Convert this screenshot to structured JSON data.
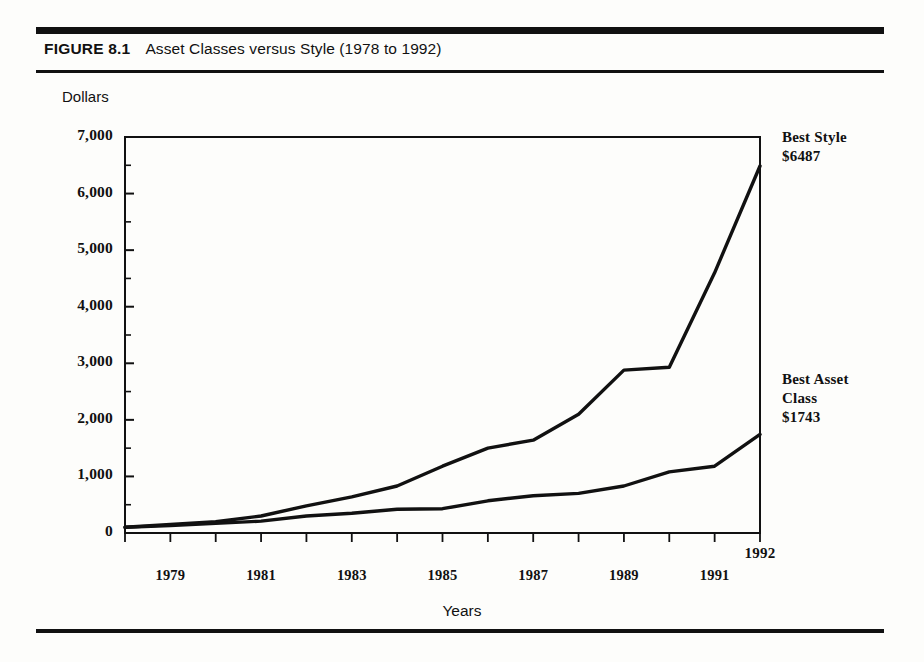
{
  "figure": {
    "number_label": "FIGURE 8.1",
    "caption": "Asset Classes versus Style (1978 to 1992)"
  },
  "annotations": {
    "best_style": {
      "line1": "Best Style",
      "line2": "$6487"
    },
    "best_asset_class": {
      "line1": "Best Asset",
      "line2": "Class",
      "line3": "$1743"
    }
  },
  "chart_data": {
    "type": "line",
    "title": "Asset Classes versus Style (1978 to 1992)",
    "xlabel": "Years",
    "ylabel": "Dollars",
    "xlim": [
      1978,
      1992
    ],
    "ylim": [
      0,
      7000
    ],
    "grid": false,
    "legend_position": "right-inline-annotations",
    "x": [
      1978,
      1979,
      1980,
      1981,
      1982,
      1983,
      1984,
      1985,
      1986,
      1987,
      1988,
      1989,
      1990,
      1991,
      1992
    ],
    "x_tick_labels": [
      "1979",
      "1981",
      "1983",
      "1985",
      "1987",
      "1989",
      "1991",
      "1992"
    ],
    "y_tick_labels": [
      "0",
      "1,000",
      "2,000",
      "3,000",
      "4,000",
      "5,000",
      "6,000",
      "7,000"
    ],
    "y_ticks": [
      0,
      1000,
      2000,
      3000,
      4000,
      5000,
      6000,
      7000
    ],
    "y_minor_ticks": [
      500,
      1500,
      2500,
      3500,
      4500,
      5500,
      6500
    ],
    "series": [
      {
        "name": "Best Style",
        "end_label": "$6487",
        "color": "#111111",
        "values": [
          100,
          150,
          200,
          300,
          480,
          640,
          830,
          1180,
          1500,
          1640,
          2100,
          2880,
          2930,
          4600,
          6487
        ]
      },
      {
        "name": "Best Asset Class",
        "end_label": "$1743",
        "color": "#111111",
        "values": [
          100,
          130,
          170,
          210,
          300,
          350,
          420,
          430,
          570,
          660,
          700,
          830,
          1080,
          1180,
          1743
        ]
      }
    ]
  }
}
